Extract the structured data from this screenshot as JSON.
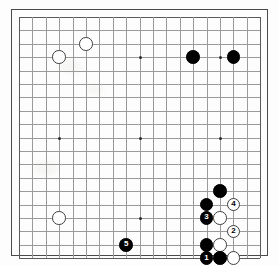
{
  "app": {
    "title": "Go Board Diagram",
    "board_size": 19,
    "description": "19x19 Go game position diagram with numbered move sequence 1-5"
  },
  "board": {
    "columns": 19,
    "rows": 19,
    "line_color": "#9a9a9a",
    "edge_color": "#5a5a5a",
    "background_color": "#fdfdfd",
    "star_points": [
      {
        "col": 4,
        "row": 4
      },
      {
        "col": 10,
        "row": 4
      },
      {
        "col": 16,
        "row": 4
      },
      {
        "col": 4,
        "row": 10
      },
      {
        "col": 10,
        "row": 10
      },
      {
        "col": 16,
        "row": 10
      },
      {
        "col": 4,
        "row": 16
      },
      {
        "col": 10,
        "row": 16
      },
      {
        "col": 16,
        "row": 16
      }
    ]
  },
  "stones": [
    {
      "id": "w-c4-r4",
      "color": "white",
      "col": 4,
      "row": 4,
      "label": ""
    },
    {
      "id": "w-c6-r3",
      "color": "white",
      "col": 6,
      "row": 3,
      "label": ""
    },
    {
      "id": "b-c14-r4",
      "color": "black",
      "col": 14,
      "row": 4,
      "label": ""
    },
    {
      "id": "b-c17-r4",
      "color": "black",
      "col": 17,
      "row": 4,
      "label": ""
    },
    {
      "id": "w-c4-r16",
      "color": "white",
      "col": 4,
      "row": 16,
      "label": ""
    },
    {
      "id": "b-c16-r14",
      "color": "black",
      "col": 16,
      "row": 14,
      "label": ""
    },
    {
      "id": "b-c15-r15",
      "color": "black",
      "col": 15,
      "row": 15,
      "label": ""
    },
    {
      "id": "w-c17-r15",
      "color": "white",
      "col": 17,
      "row": 15,
      "label": "4"
    },
    {
      "id": "b-c15-r16",
      "color": "black",
      "col": 15,
      "row": 16,
      "label": "3"
    },
    {
      "id": "w-c16-r16",
      "color": "white",
      "col": 16,
      "row": 16,
      "label": ""
    },
    {
      "id": "w-c17-r17",
      "color": "white",
      "col": 17,
      "row": 17,
      "label": "2"
    },
    {
      "id": "b-c15-r18",
      "color": "black",
      "col": 15,
      "row": 18,
      "label": ""
    },
    {
      "id": "w-c16-r18",
      "color": "white",
      "col": 16,
      "row": 18,
      "label": ""
    },
    {
      "id": "b-c15-r19",
      "color": "black",
      "col": 15,
      "row": 19,
      "label": "1"
    },
    {
      "id": "b-c16-r19",
      "color": "black",
      "col": 16,
      "row": 19,
      "label": ""
    },
    {
      "id": "w-c17-r19",
      "color": "white",
      "col": 17,
      "row": 19,
      "label": ""
    },
    {
      "id": "b-c9-r18",
      "color": "black",
      "col": 9,
      "row": 18,
      "label": "5"
    }
  ],
  "move_sequence": [
    {
      "number": "1",
      "color": "black",
      "col": 15,
      "row": 19
    },
    {
      "number": "2",
      "color": "white",
      "col": 17,
      "row": 17
    },
    {
      "number": "3",
      "color": "black",
      "col": 15,
      "row": 16
    },
    {
      "number": "4",
      "color": "white",
      "col": 17,
      "row": 15
    },
    {
      "number": "5",
      "color": "black",
      "col": 9,
      "row": 18
    }
  ],
  "geometry": {
    "origin_x": 19,
    "origin_y": 17,
    "spacing": 13.4,
    "stone_diameter": 13.6,
    "frame_pad": 8
  }
}
